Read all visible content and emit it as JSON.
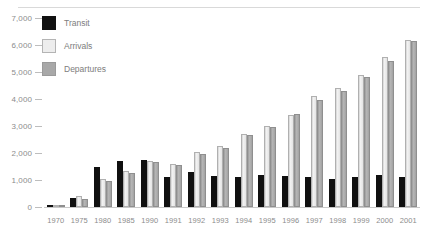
{
  "chart_data": {
    "type": "bar",
    "title": "",
    "subtitle": "",
    "xlabel": "",
    "ylabel": "",
    "ylim": [
      0,
      7000
    ],
    "ytick_step": 1000,
    "ytick_labels": [
      "7,000",
      "6,000",
      "5,000",
      "4,000",
      "3,000",
      "2,000",
      "1,000",
      "0"
    ],
    "ytick_values": [
      7000,
      6000,
      5000,
      4000,
      3000,
      2000,
      1000,
      0
    ],
    "grid": false,
    "legend_position": "top-left",
    "categories": [
      "1970",
      "1975",
      "1980",
      "1985",
      "1990",
      "1991",
      "1992",
      "1993",
      "1994",
      "1995",
      "1996",
      "1997",
      "1998",
      "1999",
      "2000",
      "2001"
    ],
    "series": [
      {
        "name": "Transit",
        "color": "#101010",
        "values": [
          60,
          350,
          1500,
          1700,
          1750,
          1100,
          1300,
          1150,
          1120,
          1200,
          1150,
          1100,
          1050,
          1100,
          1200,
          1100
        ]
      },
      {
        "name": "Arrivals",
        "color": "#ededed",
        "values": [
          70,
          400,
          1050,
          1350,
          1700,
          1600,
          2050,
          2250,
          2700,
          3000,
          3400,
          4100,
          4400,
          4900,
          5550,
          6200
        ]
      },
      {
        "name": "Departures",
        "color": "#a8a8a8",
        "values": [
          55,
          300,
          950,
          1250,
          1650,
          1550,
          1950,
          2200,
          2650,
          2950,
          3450,
          3950,
          4300,
          4800,
          5400,
          6150
        ]
      }
    ]
  },
  "legend": {
    "items": [
      {
        "label": "Transit",
        "swatch": "transit"
      },
      {
        "label": "Arrivals",
        "swatch": "arrivals"
      },
      {
        "label": "Departures",
        "swatch": "departures"
      }
    ]
  }
}
